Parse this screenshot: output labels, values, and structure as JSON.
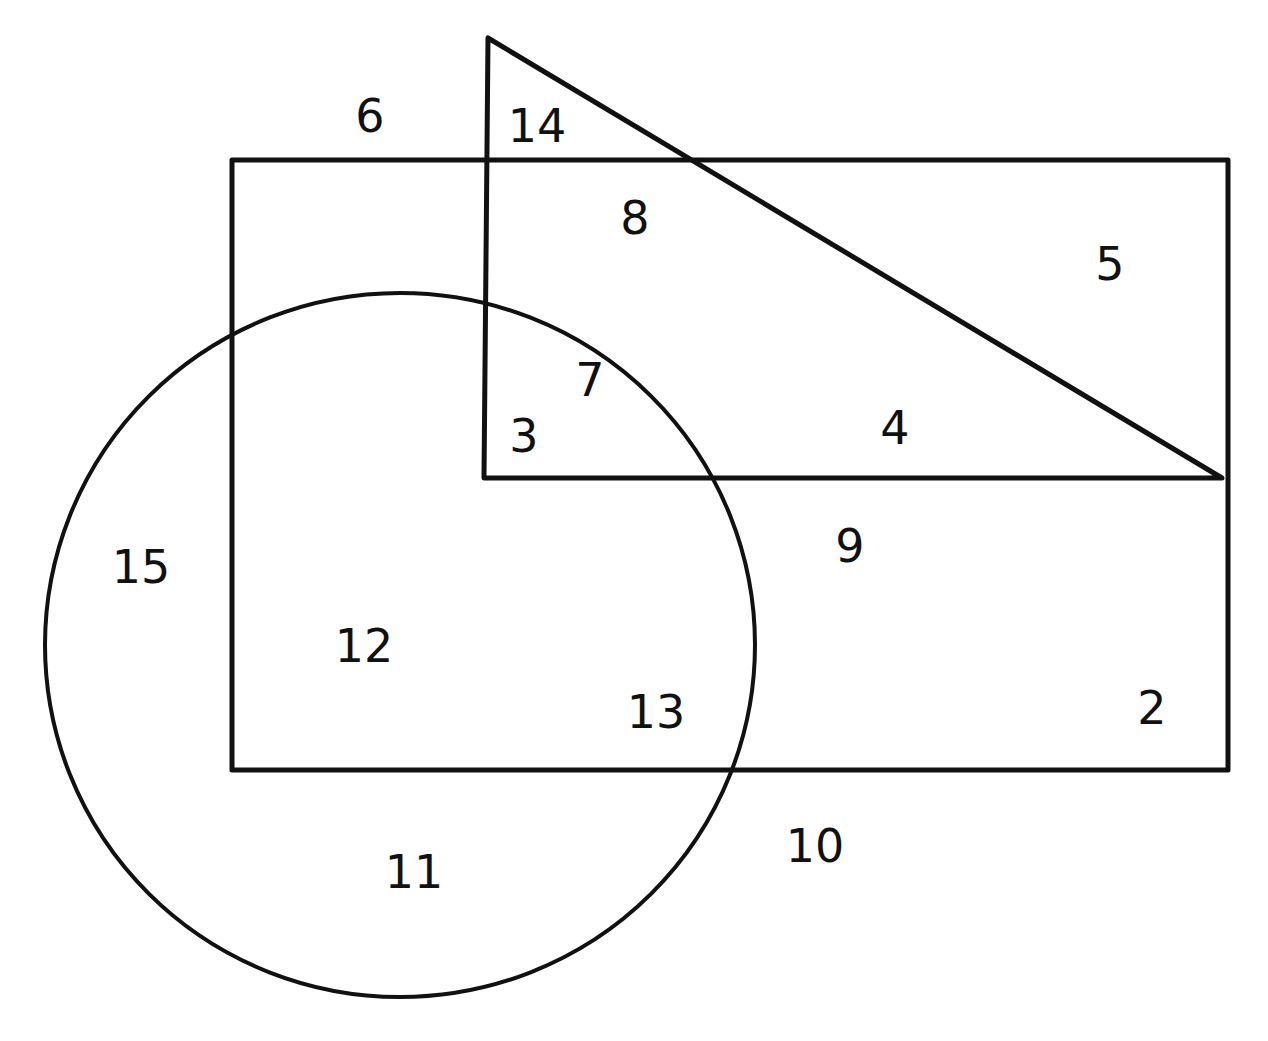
{
  "diagram": {
    "title": "",
    "stroke_color": "#111111",
    "background": "#ffffff",
    "shapes": {
      "rectangle": {
        "x": 232,
        "y": 160,
        "width": 996,
        "height": 610,
        "stroke_width": 5
      },
      "triangle": {
        "points": "488,38 484,478 1222,478",
        "stroke_width": 5
      },
      "circle": {
        "cx": 400,
        "cy": 645,
        "rx": 355,
        "ry": 352,
        "stroke_width": 4
      }
    },
    "regions": [
      {
        "id": "2",
        "label": "2",
        "x": 1152,
        "y": 708
      },
      {
        "id": "3",
        "label": "3",
        "x": 524,
        "y": 436
      },
      {
        "id": "4",
        "label": "4",
        "x": 895,
        "y": 428
      },
      {
        "id": "5",
        "label": "5",
        "x": 1110,
        "y": 264
      },
      {
        "id": "6",
        "label": "6",
        "x": 370,
        "y": 116
      },
      {
        "id": "7",
        "label": "7",
        "x": 590,
        "y": 380
      },
      {
        "id": "8",
        "label": "8",
        "x": 635,
        "y": 218
      },
      {
        "id": "9",
        "label": "9",
        "x": 850,
        "y": 546
      },
      {
        "id": "10",
        "label": "10",
        "x": 815,
        "y": 846
      },
      {
        "id": "11",
        "label": "11",
        "x": 414,
        "y": 872
      },
      {
        "id": "12",
        "label": "12",
        "x": 364,
        "y": 646
      },
      {
        "id": "13",
        "label": "13",
        "x": 656,
        "y": 712
      },
      {
        "id": "14",
        "label": "14",
        "x": 537,
        "y": 126
      },
      {
        "id": "15",
        "label": "15",
        "x": 141,
        "y": 567
      }
    ]
  }
}
